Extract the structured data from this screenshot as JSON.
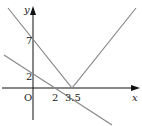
{
  "figure": {
    "axes": {
      "x_label": "x",
      "y_label": "y",
      "origin_label": "O"
    },
    "ticks": {
      "y": [
        "7",
        "2"
      ],
      "x": [
        "2",
        "3.5"
      ]
    },
    "graphs": [
      {
        "name": "absolute-value-v",
        "description": "V-shaped graph with vertex at (3.5, 0), passing through (0, 7)"
      },
      {
        "name": "line",
        "description": "Decreasing line through (0, 2) and (2, 0)"
      }
    ],
    "colors": {
      "axes": "#111111",
      "graph_lines": "#888888"
    }
  }
}
